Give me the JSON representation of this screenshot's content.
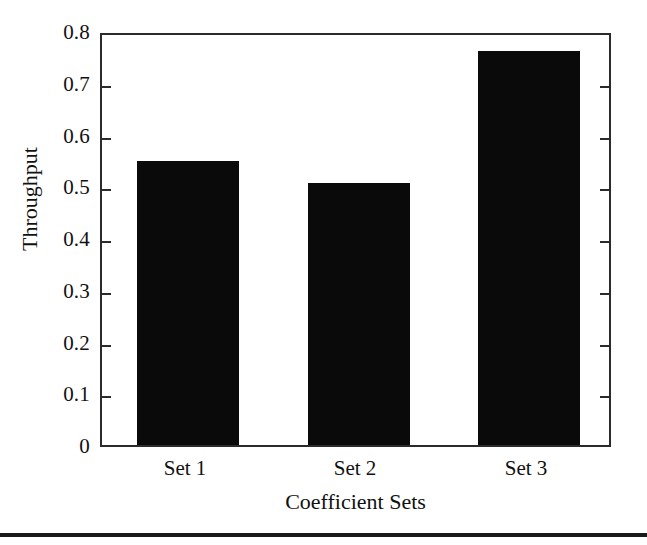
{
  "chart_data": {
    "type": "bar",
    "title": "",
    "xlabel": "Coefficient Sets",
    "ylabel": "Throughput",
    "categories": [
      "Set 1",
      "Set 2",
      "Set 3"
    ],
    "values": [
      0.549,
      0.506,
      0.761
    ],
    "ylim": [
      0,
      0.8
    ],
    "y_ticks": [
      0,
      0.1,
      0.2,
      0.3,
      0.4,
      0.5,
      0.6,
      0.7,
      0.8
    ],
    "y_tick_labels": [
      "0",
      "0.1",
      "0.2",
      "0.3",
      "0.4",
      "0.5",
      "0.6",
      "0.7",
      "0.8"
    ],
    "grid": false,
    "legend": "none",
    "bar_color": "#0a0a0a",
    "axis_color": "#2b2b2b",
    "background_color": "#ffffff"
  }
}
